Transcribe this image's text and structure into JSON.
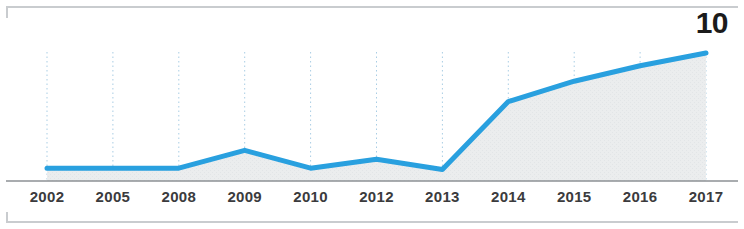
{
  "callout": {
    "value": "10"
  },
  "axis": {
    "line_color": "#8d9194"
  },
  "style": {
    "line_color": "#29a0df",
    "fill_color": "#ebedee",
    "gridline_color": "#a9cde4",
    "label_color": "#3b3b3d",
    "frame_color": "#c9cccf",
    "background": "#ffffff"
  },
  "chart_data": {
    "type": "area",
    "title": "",
    "subtitle": "",
    "xlabel": "",
    "ylabel": "",
    "categories": [
      "2002",
      "2005",
      "2008",
      "2009",
      "2010",
      "2012",
      "2013",
      "2014",
      "2015",
      "2016",
      "2017"
    ],
    "values": [
      1.0,
      1.0,
      1.0,
      2.4,
      1.0,
      1.7,
      0.9,
      6.2,
      7.8,
      9.0,
      10.0
    ],
    "series": [
      {
        "name": "value",
        "values": [
          1.0,
          1.0,
          1.0,
          2.4,
          1.0,
          1.7,
          0.9,
          6.2,
          7.8,
          9.0,
          10.0
        ]
      }
    ],
    "ylim": [
      0,
      10.8
    ],
    "xlim": [
      "2002",
      "2017"
    ],
    "grid": true,
    "grid_orientation": "vertical",
    "grid_style": "dotted",
    "legend": false,
    "legend_position": "none",
    "annotations": [
      {
        "text": "10",
        "category": "2017",
        "value": 10.0,
        "position": "top-right"
      }
    ],
    "tick_labels_x": [
      "2002",
      "2005",
      "2008",
      "2009",
      "2010",
      "2012",
      "2013",
      "2014",
      "2015",
      "2016",
      "2017"
    ],
    "tick_labels_y": []
  }
}
